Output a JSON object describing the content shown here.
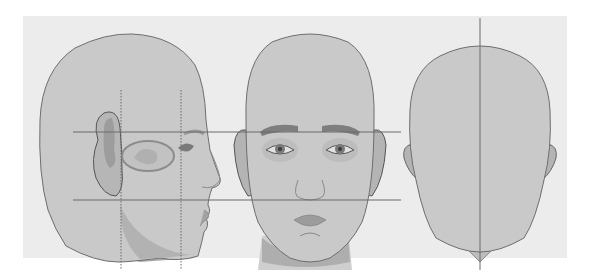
{
  "figure": {
    "views": [
      {
        "id": "profile",
        "label": "Side view"
      },
      {
        "id": "front",
        "label": "Front view"
      },
      {
        "id": "back",
        "label": "Back view"
      }
    ],
    "guides": {
      "horizontal": [
        "brow-line",
        "nose-base-line"
      ],
      "vertical_profile": [
        "ear-front-line",
        "eye-line"
      ],
      "vertical_back": [
        "center-line"
      ]
    },
    "colors": {
      "panel": "#ececec",
      "skin": "#c9c9c9",
      "skin_shadow": "#a9a9a9",
      "outline": "#6e6e6e",
      "guide_line": "#6a6a6a",
      "features": "#8a8a8a"
    }
  }
}
